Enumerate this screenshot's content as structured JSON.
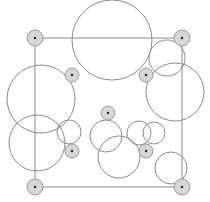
{
  "diagram": {
    "title": "",
    "colors": {
      "background": "#ffffff",
      "stroke": "#8a8a8a",
      "marker_fill": "#d6d6d6",
      "marker_stroke": "#9a9a9a",
      "center_dot": "#222222"
    },
    "frame": {
      "x1": 35,
      "y1": 38,
      "x2": 182,
      "y2": 187
    },
    "markers": [
      {
        "name": "corner-top-left",
        "cx": 35,
        "cy": 38,
        "r": 8
      },
      {
        "name": "corner-top-right",
        "cx": 182,
        "cy": 38,
        "r": 8
      },
      {
        "name": "corner-bottom-left",
        "cx": 35,
        "cy": 187,
        "r": 8
      },
      {
        "name": "corner-bottom-right",
        "cx": 182,
        "cy": 187,
        "r": 8
      },
      {
        "name": "inner-top-left",
        "cx": 72,
        "cy": 75,
        "r": 7
      },
      {
        "name": "inner-top-right",
        "cx": 146,
        "cy": 75,
        "r": 7
      },
      {
        "name": "inner-bottom-left",
        "cx": 72,
        "cy": 151,
        "r": 7
      },
      {
        "name": "inner-bottom-right",
        "cx": 146,
        "cy": 151,
        "r": 7
      },
      {
        "name": "center",
        "cx": 108,
        "cy": 113,
        "r": 7
      }
    ],
    "circles": [
      {
        "name": "top-large",
        "cx": 112,
        "cy": 40,
        "r": 40
      },
      {
        "name": "left-upper",
        "cx": 41,
        "cy": 99,
        "r": 34
      },
      {
        "name": "left-lower",
        "cx": 37,
        "cy": 143,
        "r": 28
      },
      {
        "name": "left-small",
        "cx": 69,
        "cy": 132,
        "r": 12
      },
      {
        "name": "right-upper-small",
        "cx": 167,
        "cy": 58,
        "r": 18
      },
      {
        "name": "right-large",
        "cx": 175,
        "cy": 92,
        "r": 29
      },
      {
        "name": "center-upper",
        "cx": 106,
        "cy": 136,
        "r": 16
      },
      {
        "name": "center-lower",
        "cx": 119,
        "cy": 157,
        "r": 21
      },
      {
        "name": "mid-right-a",
        "cx": 139,
        "cy": 133,
        "r": 12
      },
      {
        "name": "mid-right-b",
        "cx": 154,
        "cy": 133,
        "r": 11
      },
      {
        "name": "bottom-right",
        "cx": 171,
        "cy": 168,
        "r": 16
      }
    ]
  }
}
